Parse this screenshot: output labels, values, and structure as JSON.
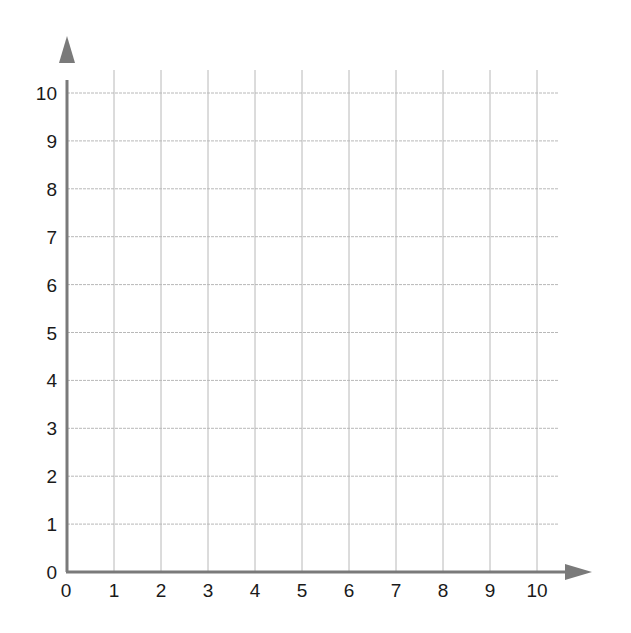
{
  "chart_data": {
    "type": "scatter",
    "title": "",
    "xlabel": "",
    "ylabel": "",
    "xlim": [
      0,
      10
    ],
    "ylim": [
      0,
      10
    ],
    "grid": true,
    "x_ticks": [
      "0",
      "1",
      "2",
      "3",
      "4",
      "5",
      "6",
      "7",
      "8",
      "9",
      "10"
    ],
    "y_ticks": [
      "0",
      "1",
      "2",
      "3",
      "4",
      "5",
      "6",
      "7",
      "8",
      "9",
      "10"
    ],
    "series": [],
    "legend": null
  },
  "colors": {
    "axis": "#7a7a7a",
    "grid": "#b8b8b8",
    "text": "#1a1a1a"
  }
}
